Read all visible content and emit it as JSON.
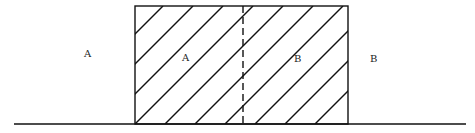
{
  "diagram": {
    "type": "hatched-region-boundary",
    "labels": {
      "outer_left": "A",
      "inner_left": "A",
      "inner_right": "B",
      "outer_right": "B"
    },
    "colors": {
      "stroke": "#111111",
      "background": "#ffffff"
    },
    "elements": {
      "baseline": {
        "x1": 14,
        "x2": 466,
        "y": 124
      },
      "rectangle": {
        "x": 135,
        "y": 6,
        "width": 213,
        "height": 118,
        "fill": "diagonal-hatch"
      },
      "divider": {
        "x": 243,
        "style": "dashed"
      }
    }
  }
}
